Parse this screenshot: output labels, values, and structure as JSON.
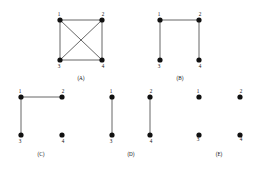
{
  "figure": {
    "background_color": "#ffffff",
    "node_color": "#111111",
    "edge_color": "#555555",
    "label_color": "#111111",
    "node_labels": [
      "1",
      "2",
      "3",
      "4"
    ],
    "graphs": [
      {
        "caption": "(A)",
        "origin": {
          "x": 60,
          "y": 20
        },
        "width": 42,
        "height": 40,
        "caption_x": 81,
        "caption_y": 76,
        "nodes": [
          {
            "id": "1",
            "label": "1",
            "cx": 0,
            "cy": 0,
            "label_dx": -1,
            "label_dy": -8
          },
          {
            "id": "2",
            "label": "2",
            "cx": 42,
            "cy": 0,
            "label_dx": 1,
            "label_dy": -8
          },
          {
            "id": "3",
            "label": "3",
            "cx": 0,
            "cy": 40,
            "label_dx": -1,
            "label_dy": 4
          },
          {
            "id": "4",
            "label": "4",
            "cx": 42,
            "cy": 40,
            "label_dx": 1,
            "label_dy": 4
          }
        ],
        "edges": [
          {
            "from": "1",
            "to": "2"
          },
          {
            "from": "3",
            "to": "4"
          },
          {
            "from": "1",
            "to": "3"
          },
          {
            "from": "2",
            "to": "4"
          },
          {
            "from": "1",
            "to": "4"
          },
          {
            "from": "2",
            "to": "3"
          }
        ],
        "edge_count": 6
      },
      {
        "caption": "(B)",
        "origin": {
          "x": 160,
          "y": 20
        },
        "width": 39,
        "height": 40,
        "caption_x": 180,
        "caption_y": 76,
        "nodes": [
          {
            "id": "1",
            "label": "1",
            "cx": 0,
            "cy": 0,
            "label_dx": -1,
            "label_dy": -8
          },
          {
            "id": "2",
            "label": "2",
            "cx": 39,
            "cy": 0,
            "label_dx": 1,
            "label_dy": -8
          },
          {
            "id": "3",
            "label": "3",
            "cx": 0,
            "cy": 40,
            "label_dx": -1,
            "label_dy": 4
          },
          {
            "id": "4",
            "label": "4",
            "cx": 39,
            "cy": 40,
            "label_dx": 1,
            "label_dy": 4
          }
        ],
        "edges": [
          {
            "from": "1",
            "to": "2"
          },
          {
            "from": "1",
            "to": "3"
          },
          {
            "from": "2",
            "to": "4"
          }
        ],
        "edge_count": 3
      },
      {
        "caption": "(C)",
        "origin": {
          "x": 21,
          "y": 97
        },
        "width": 41,
        "height": 38,
        "caption_x": 41,
        "caption_y": 152,
        "nodes": [
          {
            "id": "1",
            "label": "1",
            "cx": 0,
            "cy": 0,
            "label_dx": -1,
            "label_dy": -8
          },
          {
            "id": "2",
            "label": "2",
            "cx": 41,
            "cy": 0,
            "label_dx": 1,
            "label_dy": -8
          },
          {
            "id": "3",
            "label": "3",
            "cx": 0,
            "cy": 38,
            "label_dx": -1,
            "label_dy": 4
          },
          {
            "id": "4",
            "label": "4",
            "cx": 41,
            "cy": 38,
            "label_dx": 1,
            "label_dy": 4
          }
        ],
        "edges": [
          {
            "from": "1",
            "to": "2"
          },
          {
            "from": "1",
            "to": "3"
          }
        ],
        "edge_count": 2
      },
      {
        "caption": "(D)",
        "origin": {
          "x": 112,
          "y": 97
        },
        "width": 38,
        "height": 38,
        "caption_x": 131,
        "caption_y": 152,
        "nodes": [
          {
            "id": "1",
            "label": "1",
            "cx": 0,
            "cy": 0,
            "label_dx": -1,
            "label_dy": -8
          },
          {
            "id": "2",
            "label": "2",
            "cx": 38,
            "cy": 0,
            "label_dx": 1,
            "label_dy": -8
          },
          {
            "id": "3",
            "label": "3",
            "cx": 0,
            "cy": 38,
            "label_dx": -1,
            "label_dy": 4
          },
          {
            "id": "4",
            "label": "4",
            "cx": 38,
            "cy": 38,
            "label_dx": 1,
            "label_dy": 4
          }
        ],
        "edges": [
          {
            "from": "1",
            "to": "3"
          },
          {
            "from": "2",
            "to": "4"
          }
        ],
        "edge_count": 2
      },
      {
        "caption": "(E)",
        "origin": {
          "x": 199,
          "y": 97
        },
        "width": 41,
        "height": 38,
        "caption_x": 219,
        "caption_y": 152,
        "nodes": [
          {
            "id": "1",
            "label": "1",
            "cx": 0,
            "cy": 0,
            "label_dx": -1,
            "label_dy": -8
          },
          {
            "id": "2",
            "label": "2",
            "cx": 41,
            "cy": 0,
            "label_dx": 1,
            "label_dy": -8
          },
          {
            "id": "3",
            "label": "3",
            "cx": 0,
            "cy": 38,
            "label_dx": -1,
            "label_dy": 2
          },
          {
            "id": "4",
            "label": "4",
            "cx": 41,
            "cy": 38,
            "label_dx": 1,
            "label_dy": 2
          }
        ],
        "edges": [],
        "edge_count": 0
      }
    ]
  }
}
